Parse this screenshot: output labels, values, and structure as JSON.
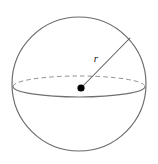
{
  "figure": {
    "background_color": "#ffffff",
    "width": 158,
    "height": 164,
    "labels": {
      "radius": "r"
    },
    "colors": {
      "outline": "#6b6b6b",
      "equator_solid": "#707070",
      "equator_dashed": "#8f8f8f",
      "radius_line": "#5a5a5a",
      "center_dot": "#000000",
      "label_text": "#1a1a1a"
    },
    "geometry": {
      "sphere_center_x": 79,
      "sphere_center_y": 84,
      "sphere_radius": 67,
      "equator_center_x": 79,
      "equator_center_y": 86.5,
      "equator_rx": 66,
      "equator_ry": 10.5,
      "center_dot_x": 81,
      "center_dot_y": 88,
      "center_dot_radius": 3.6,
      "radius_end_x": 130,
      "radius_end_y": 38,
      "label_radius_x": 96,
      "label_radius_y": 62
    }
  }
}
